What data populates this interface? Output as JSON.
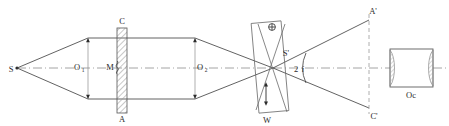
{
  "figure": {
    "kind": "optical-ray-diagram",
    "background_color": "#ffffff",
    "line_color": "#3a3a3a",
    "axis_color": "#8e8e8e",
    "hatch_color": "#9a9a9a",
    "width": 449,
    "height": 126
  },
  "labels": {
    "source": "S",
    "objective_one": "O",
    "objective_one_sub": "1",
    "mirror": "M",
    "plate_top": "C",
    "plate_bottom": "A",
    "objective_two": "O",
    "objective_two_sub": "2",
    "image_point": "S'",
    "angle": "2",
    "angle_italic": "i",
    "wedge": "W",
    "image_top": "A'",
    "image_bottom": "C'",
    "eyepiece": "Oc",
    "polarization_symbol": "⊕"
  },
  "geometry": {
    "axis_y": 68,
    "source_point": {
      "x": 17,
      "y": 68
    },
    "crossing_point": {
      "x": 273,
      "y": 68
    },
    "aperture_one_x": 88,
    "aperture_two_x": 195,
    "beam_top_y": 38,
    "beam_bottom_y": 99,
    "plate_x_left": 117,
    "plate_x_right": 127,
    "plate_y_top": 28,
    "plate_y_bottom": 113,
    "wedge_box": {
      "x": 255,
      "y": 22,
      "w": 30,
      "h": 90
    },
    "image_plane_x": 369,
    "image_top_y": 20,
    "image_bottom_y": 108,
    "eyepiece_box": {
      "x": 390,
      "y": 49,
      "w": 43,
      "h": 38
    }
  },
  "annotations": {
    "polarization_marker_pos": {
      "x": 272,
      "y": 27
    },
    "vibration_arrow": {
      "x": 266,
      "y_top": 83,
      "y_bottom": 105
    },
    "angle_arc_label_pos": {
      "x": 297,
      "y": 71
    }
  }
}
